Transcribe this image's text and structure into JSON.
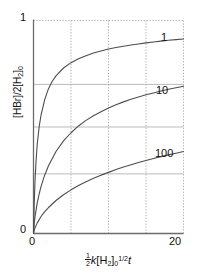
{
  "chart_data": {
    "type": "line",
    "title": "",
    "xlabel": "(1/2)k[H2]0^(1/2) t",
    "ylabel": "[HBr]/2[H2]0",
    "xlim": [
      0,
      20
    ],
    "ylim": [
      0,
      1
    ],
    "grid": true,
    "legend_position": "inline-right",
    "x_ticks": [
      {
        "value": 0,
        "label": "0"
      },
      {
        "value": 20,
        "label": "20"
      }
    ],
    "y_ticks": [
      {
        "value": 0,
        "label": "0"
      },
      {
        "value": 1,
        "label": "1"
      }
    ],
    "x_gridlines": [
      5,
      10,
      15
    ],
    "y_gridlines": [
      0.28,
      0.5,
      0.7
    ],
    "series": [
      {
        "name": "1",
        "label": "1",
        "color": "#4d4d4d",
        "label_x": 17.8,
        "label_y": 0.905,
        "x": [
          0,
          0.1,
          0.2,
          0.35,
          0.5,
          0.75,
          1,
          1.5,
          2,
          2.5,
          3,
          4,
          5,
          6,
          7,
          8,
          9,
          10,
          11,
          12,
          13,
          14,
          15,
          16,
          17,
          18,
          19,
          20
        ],
        "y": [
          0,
          0.145,
          0.245,
          0.345,
          0.42,
          0.5,
          0.555,
          0.63,
          0.68,
          0.715,
          0.74,
          0.777,
          0.802,
          0.82,
          0.835,
          0.847,
          0.857,
          0.866,
          0.873,
          0.879,
          0.885,
          0.89,
          0.895,
          0.899,
          0.903,
          0.907,
          0.91,
          0.913
        ]
      },
      {
        "name": "10",
        "label": "10",
        "color": "#4d4d4d",
        "label_x": 16.6,
        "label_y": 0.635,
        "x": [
          0,
          0.1,
          0.25,
          0.5,
          0.75,
          1,
          1.5,
          2,
          3,
          4,
          5,
          6,
          7,
          8,
          9,
          10,
          11,
          12,
          13,
          14,
          15,
          16,
          17,
          18,
          19,
          20
        ],
        "y": [
          0,
          0.05,
          0.09,
          0.145,
          0.185,
          0.22,
          0.275,
          0.318,
          0.385,
          0.435,
          0.473,
          0.505,
          0.531,
          0.553,
          0.572,
          0.589,
          0.604,
          0.618,
          0.63,
          0.641,
          0.651,
          0.66,
          0.669,
          0.677,
          0.684,
          0.691
        ]
      },
      {
        "name": "100",
        "label": "100",
        "color": "#4d4d4d",
        "label_x": 16.3,
        "label_y": 0.345,
        "x": [
          0,
          0.1,
          0.25,
          0.5,
          1,
          1.5,
          2,
          3,
          4,
          5,
          6,
          7,
          8,
          9,
          10,
          11,
          12,
          13,
          14,
          15,
          16,
          17,
          18,
          19,
          20
        ],
        "y": [
          0,
          0.017,
          0.03,
          0.05,
          0.08,
          0.103,
          0.122,
          0.155,
          0.182,
          0.205,
          0.225,
          0.243,
          0.259,
          0.274,
          0.287,
          0.3,
          0.312,
          0.323,
          0.333,
          0.343,
          0.352,
          0.361,
          0.369,
          0.377,
          0.385
        ]
      }
    ],
    "style": {
      "axis_color": "#6b6b6b",
      "curve_color": "#4d4d4d",
      "hgrid_color": "#aaaaaa",
      "vgrid_color": "#9a9a9a",
      "background": "#ffffff"
    }
  },
  "axis_titles": {
    "y": {
      "open_bracket": "[",
      "species": "HBr",
      "close_bracket": "]",
      "slash": "/2[",
      "species2": "H",
      "sub2": "2",
      "close2": "]",
      "sub0": "0"
    },
    "x": {
      "frac_num": "1",
      "frac_den": "2",
      "k": "k",
      "open": "[",
      "species": "H",
      "sub2": "2",
      "close": "]",
      "sub0": "0",
      "exponent": "1/2",
      "t": "t"
    }
  }
}
